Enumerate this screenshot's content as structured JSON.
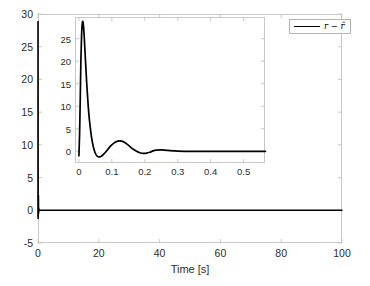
{
  "chart_data": {
    "type": "line",
    "title": "",
    "xlabel": "Time [s]",
    "ylabel": "",
    "xlim": [
      0,
      100
    ],
    "ylim": [
      -5,
      30
    ],
    "xticks": [
      0,
      20,
      40,
      60,
      80,
      100
    ],
    "yticks": [
      -5,
      0,
      5,
      10,
      15,
      20,
      25,
      30
    ],
    "xtick_labels": [
      "0",
      "20",
      "40",
      "60",
      "80",
      "100"
    ],
    "ytick_labels": [
      "-5",
      "0",
      "5",
      "10",
      "15",
      "20",
      "25",
      "30"
    ],
    "grid": false,
    "legend": {
      "position": "top-right",
      "entries": [
        {
          "label": "r − r̂",
          "color": "#000000",
          "style": "solid"
        }
      ]
    },
    "series": [
      {
        "name": "r − r̂",
        "color": "#000000",
        "comment": "Estimation error: sharp transient spike near t=0 peaking at ~28.8, damped oscillation settles to 0 by t≈0.35 s, flat at 0 thereafter to t=100 s",
        "x": [
          0,
          0.002,
          0.004,
          0.006,
          0.008,
          0.01,
          0.012,
          0.014,
          0.016,
          0.018,
          0.02,
          0.024,
          0.028,
          0.032,
          0.038,
          0.044,
          0.05,
          0.056,
          0.062,
          0.068,
          0.075,
          0.082,
          0.09,
          0.098,
          0.106,
          0.114,
          0.122,
          0.13,
          0.138,
          0.146,
          0.155,
          0.165,
          0.175,
          0.185,
          0.195,
          0.205,
          0.215,
          0.225,
          0.235,
          0.25,
          0.27,
          0.3,
          0.35,
          0.4,
          0.45,
          0.5,
          0.56,
          1,
          5,
          10,
          20,
          30,
          40,
          50,
          60,
          70,
          80,
          90,
          100
        ],
        "y": [
          -1.0,
          4.0,
          12.0,
          20.5,
          25.8,
          28.3,
          28.8,
          27.6,
          25.4,
          22.7,
          19.9,
          14.6,
          10.2,
          6.8,
          3.2,
          0.9,
          -0.5,
          -1.15,
          -1.25,
          -1.1,
          -0.65,
          -0.1,
          0.65,
          1.3,
          1.82,
          2.15,
          2.3,
          2.25,
          2.0,
          1.6,
          1.05,
          0.45,
          0.0,
          -0.32,
          -0.46,
          -0.42,
          -0.22,
          0.08,
          0.25,
          0.3,
          0.18,
          0.05,
          0.0,
          0.0,
          0.0,
          0.0,
          0.0,
          0,
          0,
          0,
          0,
          0,
          0,
          0,
          0,
          0,
          0,
          0,
          0
        ]
      }
    ],
    "inset": {
      "xlim": [
        -0.012,
        0.565
      ],
      "ylim": [
        -2.6,
        29.8
      ],
      "xticks": [
        0,
        0.1,
        0.2,
        0.3,
        0.4,
        0.5
      ],
      "yticks": [
        0,
        5,
        10,
        15,
        20,
        25
      ],
      "xtick_labels": [
        "0",
        "0.1",
        "0.2",
        "0.3",
        "0.4",
        "0.5"
      ],
      "ytick_labels": [
        "0",
        "5",
        "10",
        "15",
        "20",
        "25"
      ],
      "grid": false
    }
  }
}
